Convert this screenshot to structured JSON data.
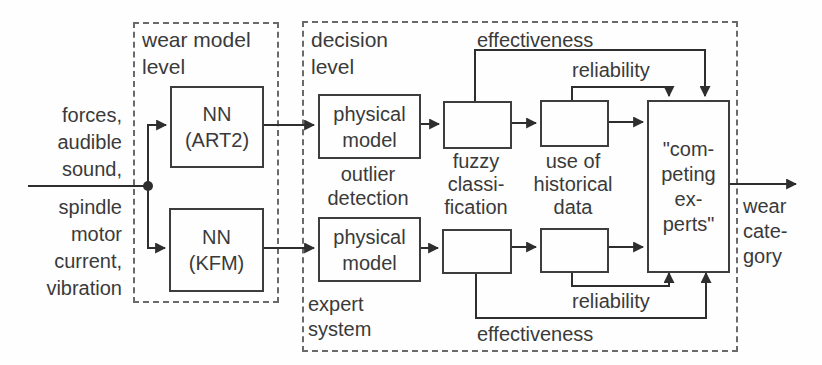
{
  "inputs": {
    "top_label": "forces,\naudible\nsound,",
    "bottom_label": "spindle\nmotor\ncurrent,\nvibration"
  },
  "groups": {
    "wear_model": "wear model\nlevel",
    "decision": "decision\nlevel"
  },
  "boxes": {
    "nn_art2": "NN\n(ART2)",
    "nn_kfm": "NN\n(KFM)",
    "physical_top": "physical\nmodel",
    "physical_bottom": "physical\nmodel",
    "competing_experts": "\"com-\npeting\nex-\nperts\""
  },
  "labels": {
    "outlier_detection": "outlier\ndetection",
    "expert_system": "expert\nsystem",
    "fuzzy_classification": "fuzzy\nclassi-\nfication",
    "historical_data": "use of\nhistorical\ndata",
    "effectiveness_top": "effectiveness",
    "reliability_top": "reliability",
    "reliability_bottom": "reliability",
    "effectiveness_bottom": "effectiveness",
    "output": "wear\ncate-\ngory"
  },
  "colors": {
    "ink": "#3a3a3a",
    "line": "#2e2e2e",
    "background": "#fefefe"
  }
}
